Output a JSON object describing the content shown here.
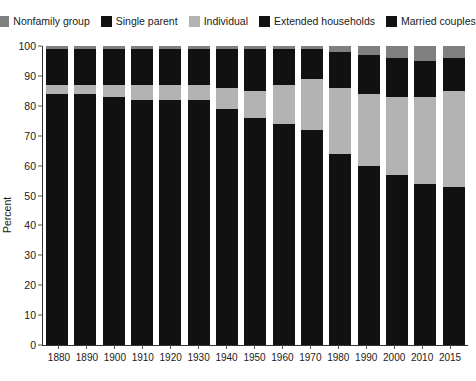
{
  "chart_data": {
    "type": "bar",
    "subtype": "stacked-bar-100pct",
    "title": "",
    "xlabel": "",
    "ylabel": "Percent",
    "ylim": [
      0,
      100
    ],
    "yticks": [
      0,
      10,
      20,
      30,
      40,
      50,
      60,
      70,
      80,
      90,
      100
    ],
    "grid": false,
    "legend_position": "top",
    "categories": [
      "1880",
      "1890",
      "1900",
      "1910",
      "1920",
      "1930",
      "1940",
      "1950",
      "1960",
      "1970",
      "1980",
      "1990",
      "2000",
      "2010",
      "2015"
    ],
    "stack_order_bottom_to_top": [
      "Married couples",
      "Extended households",
      "Individual",
      "Single parent",
      "Nonfamily group"
    ],
    "series": [
      {
        "name": "Married couples",
        "color": "#111111",
        "values": [
          66,
          64,
          66,
          66,
          66,
          66,
          65,
          65,
          66,
          65,
          57,
          53,
          51,
          48,
          44
        ]
      },
      {
        "name": "Extended households",
        "color": "#111111",
        "values": [
          18,
          20,
          17,
          16,
          16,
          16,
          14,
          11,
          8,
          7,
          7,
          7,
          6,
          6,
          9
        ]
      },
      {
        "name": "Individual",
        "color": "#b3b3b3",
        "values": [
          3,
          3,
          4,
          5,
          5,
          5,
          7,
          9,
          13,
          17,
          22,
          24,
          26,
          29,
          32
        ]
      },
      {
        "name": "Single parent",
        "color": "#111111",
        "values": [
          12,
          12,
          12,
          12,
          12,
          12,
          13,
          14,
          12,
          10,
          12,
          13,
          13,
          12,
          11
        ]
      },
      {
        "name": "Nonfamily group",
        "color": "#808080",
        "values": [
          1,
          1,
          1,
          1,
          1,
          1,
          1,
          1,
          1,
          1,
          2,
          3,
          4,
          5,
          4
        ]
      }
    ]
  },
  "legend": {
    "items": [
      {
        "label": "Nonfamily group",
        "color": "#808080"
      },
      {
        "label": "Single parent",
        "color": "#111111"
      },
      {
        "label": "Individual",
        "color": "#b3b3b3"
      },
      {
        "label": "Extended households",
        "color": "#111111"
      },
      {
        "label": "Married couples",
        "color": "#111111"
      }
    ]
  },
  "axes": {
    "y_title": "Percent",
    "y_tick_labels": [
      "100",
      "90",
      "80",
      "70",
      "60",
      "50",
      "40",
      "30",
      "20",
      "10",
      "0"
    ],
    "x_tick_labels": [
      "1880",
      "1890",
      "1900",
      "1910",
      "1920",
      "1930",
      "1940",
      "1950",
      "1960",
      "1970",
      "1980",
      "1990",
      "2000",
      "2010",
      "2015"
    ]
  }
}
